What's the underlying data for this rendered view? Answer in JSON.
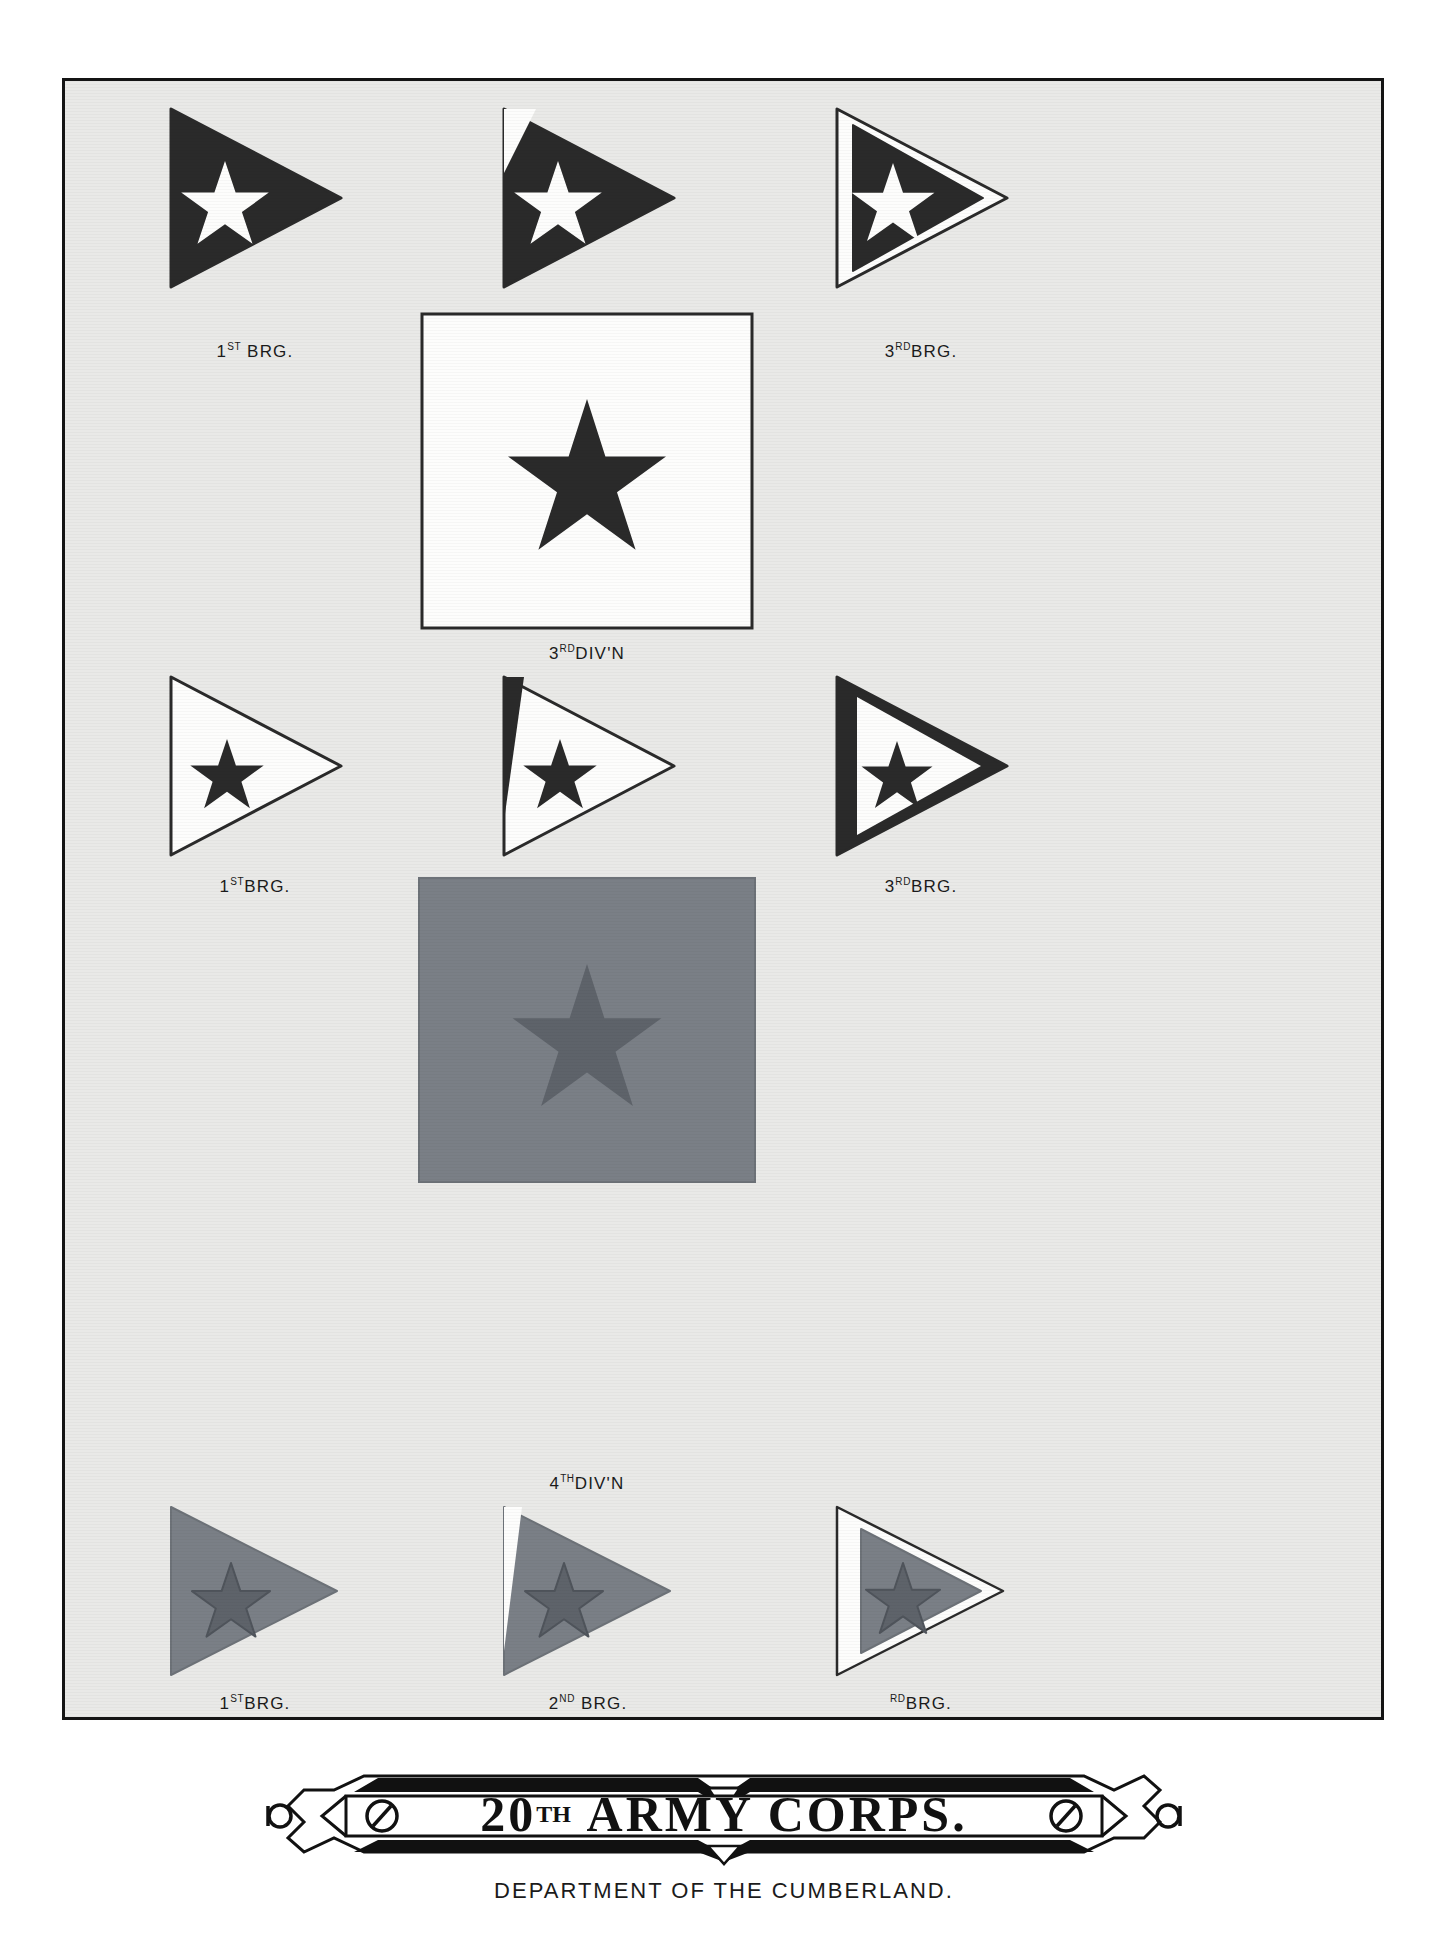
{
  "plate": {
    "background_color": "#e9e9e7",
    "border_color": "#141414"
  },
  "colors": {
    "black": "#2a2a2a",
    "white": "#fdfdfc",
    "blue_gray": "#7a7f86",
    "star_dark_on_blue": "#5e636a",
    "paper": "#e9e9e7",
    "ink": "#1b1b1b"
  },
  "divisions": [
    {
      "id": "3rd-division",
      "label_number": "3",
      "label_ordinal": "RD",
      "label_rest": "DIV'N",
      "label_full": "3RD DIV'N",
      "square_fill": "#fdfdfc",
      "star_fill": "#2a2a2a",
      "brigades": [
        {
          "id": "div3-brigade-1",
          "number": "1",
          "ordinal": "ST",
          "rest": "BRG.",
          "label_full": "1ST BRG.",
          "style": "solid",
          "field": "#2a2a2a",
          "star": "#fdfdfc",
          "trim": ""
        },
        {
          "id": "div3-brigade-2",
          "number": "2",
          "ordinal": "ND",
          "rest": "BRG.",
          "label_full": "2ND BRG.",
          "style": "corner-notch",
          "field": "#2a2a2a",
          "star": "#fdfdfc",
          "trim": "#fdfdfc"
        },
        {
          "id": "div3-brigade-3",
          "number": "3",
          "ordinal": "RD",
          "rest": "BRG.",
          "label_full": "3RD BRG.",
          "style": "bordered",
          "field": "#2a2a2a",
          "star": "#fdfdfc",
          "trim": "#fdfdfc"
        }
      ]
    },
    {
      "id": "4th-division",
      "label_number": "4",
      "label_ordinal": "TH",
      "label_rest": "DIV'N",
      "label_full": "4TH DIV'N",
      "square_fill": "#7a7f86",
      "star_fill": "#5e636a",
      "brigades": [
        {
          "id": "div4-brigade-1",
          "number": "1",
          "ordinal": "ST",
          "rest": "BRG.",
          "label_full": "1ST BRG.",
          "style": "solid",
          "field": "#7a7f86",
          "star": "#5e636a",
          "trim": ""
        },
        {
          "id": "div4-brigade-2",
          "number": "2",
          "ordinal": "ND",
          "rest": "BRG.",
          "label_full": "2ND BRG.",
          "style": "corner-notch",
          "field": "#7a7f86",
          "star": "#5e636a",
          "trim": "#fdfdfc"
        },
        {
          "id": "div4-brigade-3",
          "number": "",
          "ordinal": "RD",
          "rest": "BRG.",
          "label_full": "RD BRG.",
          "style": "bordered",
          "field": "#7a7f86",
          "star": "#5e636a",
          "trim": "#fdfdfc"
        }
      ]
    }
  ],
  "white_row": {
    "id": "white-brigade-row",
    "brigades": [
      {
        "id": "white-brigade-1",
        "number": "1",
        "ordinal": "ST",
        "rest": "BRG.",
        "label_full": "1ST BRG.",
        "style": "solid",
        "field": "#fdfdfc",
        "star": "#2a2a2a",
        "trim": "#2a2a2a"
      },
      {
        "id": "white-brigade-2",
        "number": "2",
        "ordinal": "ND",
        "rest": "BRG.",
        "label_full": "2ND BRG.",
        "style": "corner-notch",
        "field": "#fdfdfc",
        "star": "#2a2a2a",
        "trim": "#2a2a2a"
      },
      {
        "id": "white-brigade-3",
        "number": "3",
        "ordinal": "RD",
        "rest": "BRG.",
        "label_full": "3RD BRG.",
        "style": "bordered",
        "field": "#fdfdfc",
        "star": "#2a2a2a",
        "trim": "#2a2a2a"
      }
    ]
  },
  "banner": {
    "number": "20",
    "ordinal": "TH",
    "title_rest": "ARMY CORPS.",
    "title_full": "20TH ARMY CORPS.",
    "subtitle": "DEPARTMENT OF THE CUMBERLAND."
  }
}
